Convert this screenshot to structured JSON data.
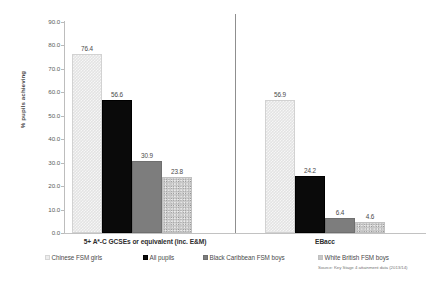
{
  "chart_data": {
    "type": "bar",
    "title": "",
    "xlabel": "",
    "ylabel": "% pupils achieving",
    "ylim": [
      0.0,
      90.0
    ],
    "ytick_step": 10.0,
    "grid": false,
    "legend_position": "bottom",
    "categories": [
      "5+ A*-C GCSEs or equivalent (inc. E&M)",
      "EBacc"
    ],
    "ytick_labels": [
      "0.0",
      "10.0",
      "20.0",
      "30.0",
      "40.0",
      "50.0",
      "60.0",
      "70.0",
      "80.0",
      "90.0"
    ],
    "series": [
      {
        "name": "Chinese FSM girls",
        "values": [
          76.4,
          56.9
        ],
        "labels": [
          "76.4",
          "56.9"
        ],
        "fill": "light-checkered",
        "color": "#e3e3e3"
      },
      {
        "name": "All pupils",
        "values": [
          56.6,
          24.2
        ],
        "labels": [
          "56.6",
          "24.2"
        ],
        "fill": "solid-black",
        "color": "#0a0a0a"
      },
      {
        "name": "Black Caribbean FSM boys",
        "values": [
          30.9,
          6.4
        ],
        "labels": [
          "30.9",
          "6.4"
        ],
        "fill": "solid-gray",
        "color": "#7d7d7d"
      },
      {
        "name": "White British FSM boys",
        "values": [
          23.8,
          4.6
        ],
        "labels": [
          "23.8",
          "4.6"
        ],
        "fill": "speckled-gray",
        "color": "#c8c8c8"
      }
    ],
    "source_note": "Source: Key Stage 4 attainment data (2013/14)"
  }
}
